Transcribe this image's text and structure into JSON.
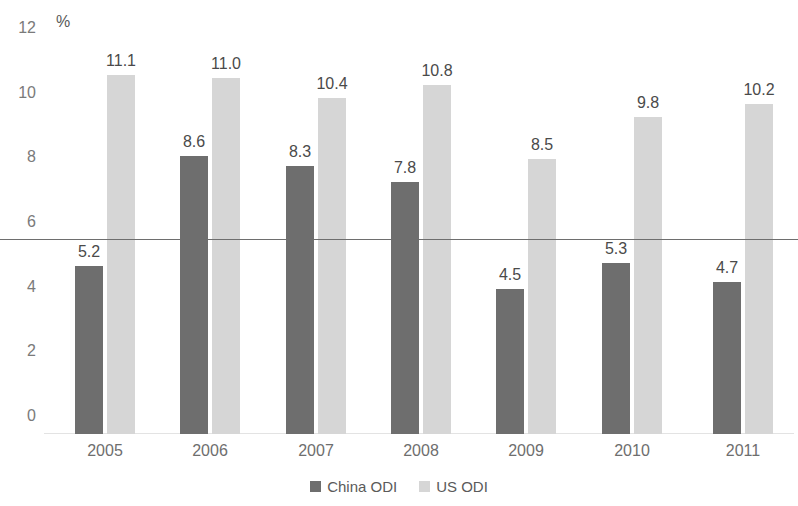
{
  "chart_data": {
    "type": "bar",
    "title": "",
    "subtitle": "",
    "xlabel": "",
    "ylabel": "%",
    "unit_label": "%",
    "categories": [
      "2005",
      "2006",
      "2007",
      "2008",
      "2009",
      "2010",
      "2011"
    ],
    "series": [
      {
        "name": "China ODI",
        "color": "#6e6e6e",
        "values": [
          5.2,
          8.6,
          8.3,
          7.8,
          4.5,
          5.3,
          4.7
        ],
        "labels": [
          "5.2",
          "8.6",
          "8.3",
          "7.8",
          "4.5",
          "5.3",
          "4.7"
        ]
      },
      {
        "name": "US ODI",
        "color": "#d6d6d6",
        "values": [
          11.1,
          11.0,
          10.4,
          10.8,
          8.5,
          9.8,
          10.2
        ],
        "labels": [
          "11.1",
          "11.0",
          "10.4",
          "10.8",
          "8.5",
          "9.8",
          "10.2"
        ]
      }
    ],
    "ylim": [
      0,
      12
    ],
    "yticks": [
      0,
      2,
      4,
      6,
      8,
      10,
      12
    ],
    "ytick_labels": [
      "0",
      "2",
      "4",
      "6",
      "8",
      "10",
      "12"
    ],
    "grid": false,
    "reference_line": {
      "value": 6,
      "color": "#6e6e6e"
    },
    "legend": {
      "position": "bottom",
      "entries": [
        {
          "label": "China ODI",
          "color": "#6e6e6e"
        },
        {
          "label": "US ODI",
          "color": "#d6d6d6"
        }
      ]
    }
  }
}
